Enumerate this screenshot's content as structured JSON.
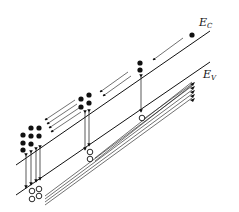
{
  "diagram": {
    "type": "semiconductor-band-diagram",
    "labels": {
      "conduction_band": {
        "main": "E",
        "sub": "C"
      },
      "valence_band": {
        "main": "E",
        "sub": "V"
      }
    },
    "colors": {
      "line": "#111111",
      "electron": "#111111",
      "hole_fill": "#ffffff",
      "background": "#ffffff"
    },
    "groups": [
      {
        "name": "right",
        "electrons": 1,
        "holes": 0,
        "recombination_arrows": 0
      },
      {
        "name": "upper-middle",
        "electrons": 2,
        "holes": 1,
        "recombination_arrows": 1
      },
      {
        "name": "middle",
        "electrons": 4,
        "holes": 2,
        "recombination_arrows": 2
      },
      {
        "name": "left",
        "electrons": 8,
        "holes": 4,
        "recombination_arrows": 3
      }
    ]
  }
}
